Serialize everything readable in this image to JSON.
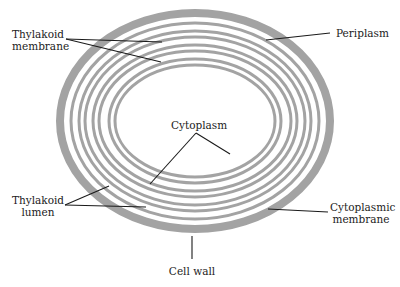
{
  "diagram": {
    "colors": {
      "background": "#ffffff",
      "membrane": "#a3a3a3",
      "leader_line": "#1a1a1a",
      "text": "#222222"
    },
    "labels": {
      "thylakoid_membrane_line1": "Thylakoid",
      "thylakoid_membrane_line2": "membrane",
      "periplasm": "Periplasm",
      "cytoplasm": "Cytoplasm",
      "thylakoid_lumen_line1": "Thylakoid",
      "thylakoid_lumen_line2": "lumen",
      "cytoplasmic_membrane_line1": "Cytoplasmic",
      "cytoplasmic_membrane_line2": "membrane",
      "cell_wall": "Cell wall"
    },
    "structures": [
      "Cell wall",
      "Periplasm",
      "Cytoplasmic membrane",
      "Thylakoid membrane",
      "Thylakoid lumen",
      "Cytoplasm"
    ]
  }
}
